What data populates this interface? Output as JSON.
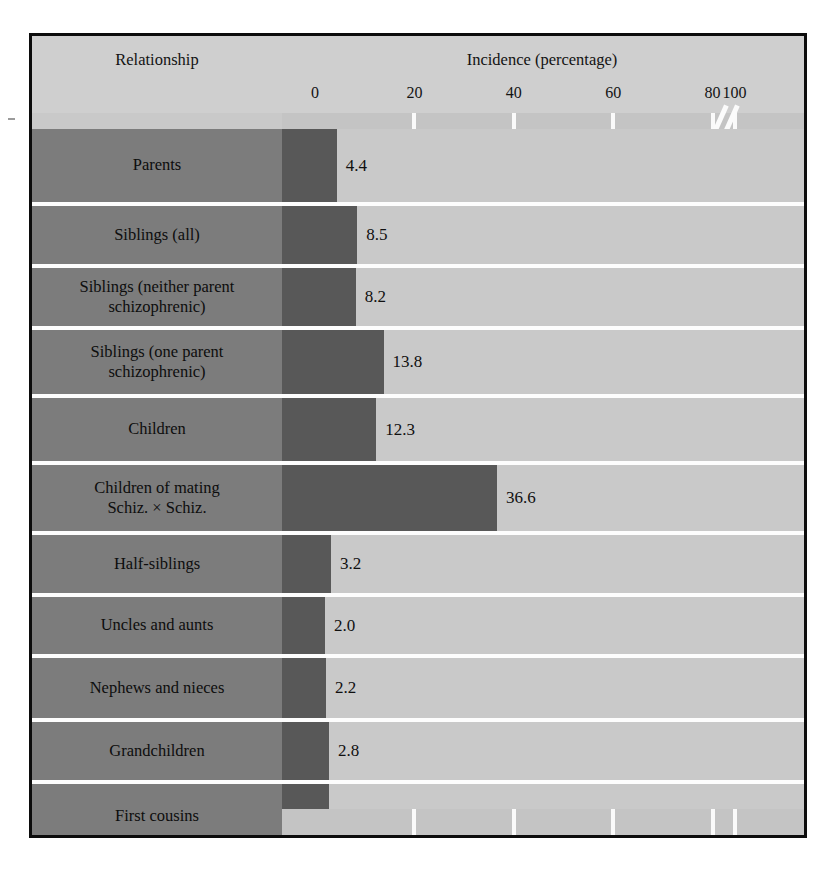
{
  "header": {
    "relationship_title": "Relationship",
    "incidence_title": "Incidence (percentage)"
  },
  "axis": {
    "ticks": [
      {
        "label": "0",
        "value": 0
      },
      {
        "label": "20",
        "value": 20
      },
      {
        "label": "40",
        "value": 40
      },
      {
        "label": "60",
        "value": 60
      },
      {
        "label": "80",
        "value": 80
      },
      {
        "label": "100",
        "value": 100
      }
    ],
    "break_between": [
      80,
      100
    ]
  },
  "colors": {
    "label_column": "#7c7c7c",
    "plot_background": "#c9c9c9",
    "bar": "#585858",
    "gridline": "#fdfdfd",
    "border": "#0c0c0c",
    "header_background": "#cfcfcf"
  },
  "chart_data": {
    "type": "bar",
    "orientation": "horizontal",
    "title": "",
    "xlabel": "Incidence (percentage)",
    "ylabel": "Relationship",
    "xlim": [
      0,
      100
    ],
    "grid": true,
    "legend": "none",
    "axis_break": true,
    "categories": [
      "Parents",
      "Siblings (all)",
      "Siblings (neither parent schizophrenic)",
      "Siblings (one parent schizophrenic)",
      "Children",
      "Children of mating Schiz. × Schiz.",
      "Half-siblings",
      "Uncles and aunts",
      "Nephews and nieces",
      "Grandchildren",
      "First cousins"
    ],
    "values": [
      4.4,
      8.5,
      8.2,
      13.8,
      12.3,
      36.6,
      3.2,
      2.0,
      2.2,
      2.8,
      2.9
    ],
    "value_labels": [
      "4.4",
      "8.5",
      "8.2",
      "13.8",
      "12.3",
      "36.6",
      "3.2",
      "2.0",
      "2.2",
      "2.8",
      "2.9"
    ]
  },
  "rows": [
    {
      "label_lines": [
        "Parents"
      ],
      "value": 4.4,
      "value_label": "4.4",
      "height": 73
    },
    {
      "label_lines": [
        "Siblings (all)"
      ],
      "value": 8.5,
      "value_label": "8.5",
      "height": 58
    },
    {
      "label_lines": [
        "Siblings (neither parent",
        "schizophrenic)"
      ],
      "value": 8.2,
      "value_label": "8.2",
      "height": 58
    },
    {
      "label_lines": [
        "Siblings (one parent",
        "schizophrenic)"
      ],
      "value": 13.8,
      "value_label": "13.8",
      "height": 64
    },
    {
      "label_lines": [
        "Children"
      ],
      "value": 12.3,
      "value_label": "12.3",
      "height": 63
    },
    {
      "label_lines": [
        "Children of mating",
        "Schiz. × Schiz."
      ],
      "value": 36.6,
      "value_label": "36.6",
      "height": 66
    },
    {
      "label_lines": [
        "Half-siblings"
      ],
      "value": 3.2,
      "value_label": "3.2",
      "height": 58
    },
    {
      "label_lines": [
        "Uncles and aunts"
      ],
      "value": 2.0,
      "value_label": "2.0",
      "height": 57
    },
    {
      "label_lines": [
        "Nephews and nieces"
      ],
      "value": 2.2,
      "value_label": "2.2",
      "height": 60
    },
    {
      "label_lines": [
        "Grandchildren"
      ],
      "value": 2.8,
      "value_label": "2.8",
      "height": 58
    },
    {
      "label_lines": [
        "First cousins"
      ],
      "value": 2.9,
      "value_label": "2.9",
      "height": 65
    }
  ]
}
